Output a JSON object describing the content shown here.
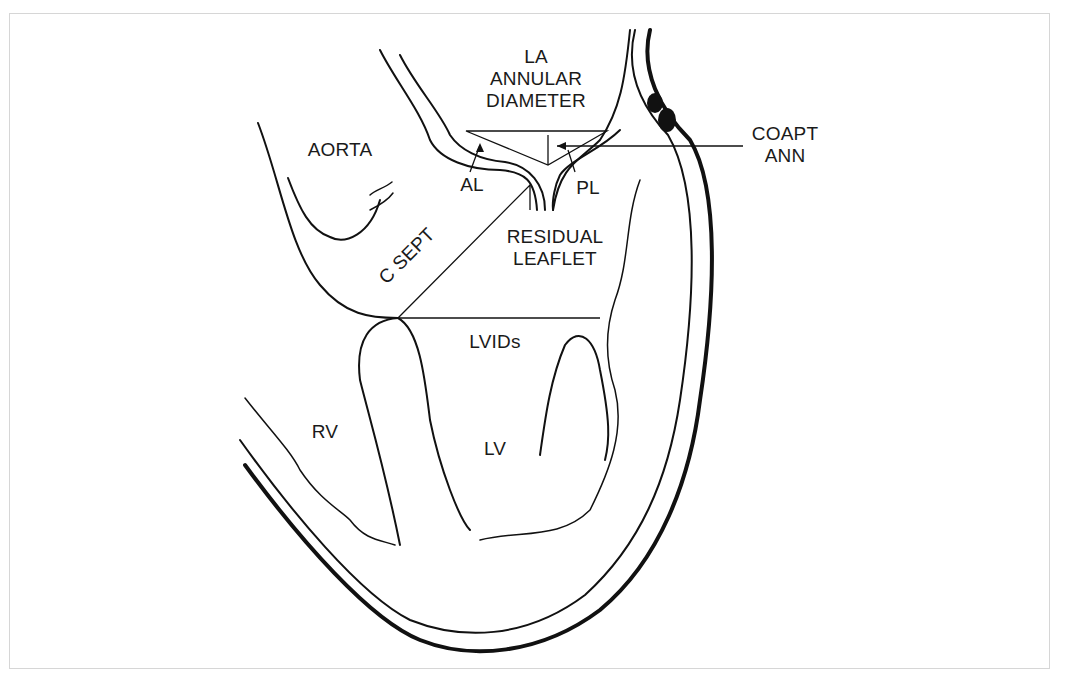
{
  "diagram": {
    "type": "anatomical-line-drawing",
    "labels": {
      "la_annular_diameter": "LA\nANNULAR\nDIAMETER",
      "aorta": "AORTA",
      "coapt_ann": "COAPT\nANN",
      "al": "AL",
      "pl": "PL",
      "residual_leaflet": "RESIDUAL\nLEAFLET",
      "c_sept": "C SEPT",
      "lvids": "LVIDs",
      "rv": "RV",
      "lv": "LV"
    },
    "colors": {
      "line": "#111111",
      "background": "#ffffff",
      "frame": "#d6d6d6"
    }
  }
}
